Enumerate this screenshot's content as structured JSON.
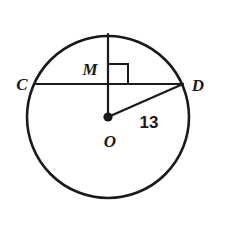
{
  "figure": {
    "type": "circle-geometry-diagram",
    "background_color": "#ffffff",
    "stroke_color": "#1a1a1a",
    "circle": {
      "name": "circle-O",
      "center_x": 108,
      "center_y": 117,
      "radius": 81,
      "stroke_width": 2.6
    },
    "center_point": {
      "label": "O",
      "x": 108,
      "y": 117,
      "dot_radius": 4.6
    },
    "chord": {
      "name": "chord-CD",
      "x1": 36,
      "y1": 84,
      "x2": 183,
      "y2": 84,
      "stroke_width": 2.2
    },
    "perpendicular_segment": {
      "name": "segment-OM-extended",
      "x1": 108,
      "y1": 34,
      "x2": 108,
      "y2": 117,
      "stroke_width": 2.2
    },
    "radius_segment": {
      "name": "radius-OD",
      "x1": 108,
      "y1": 117,
      "x2": 183,
      "y2": 84,
      "stroke_width": 2.2
    },
    "right_angle_marker": {
      "name": "right-angle-at-M",
      "size": 20,
      "x": 108,
      "y": 84,
      "stroke_width": 2.0
    }
  },
  "labels": {
    "point_c": {
      "text": "C",
      "x": 22,
      "y": 90,
      "font_size": 17
    },
    "point_d": {
      "text": "D",
      "x": 193,
      "y": 91,
      "font_size": 17
    },
    "point_m": {
      "text": "M",
      "x": 82,
      "y": 75,
      "font_size": 17
    },
    "point_o": {
      "text": "O",
      "x": 102,
      "y": 147,
      "font_size": 17
    },
    "radius_measure": {
      "text": "13",
      "x": 138,
      "y": 128,
      "font_size": 17
    }
  }
}
